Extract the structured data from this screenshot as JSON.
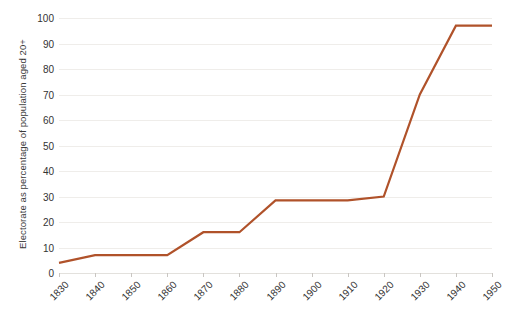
{
  "chart_data": {
    "type": "line",
    "title": "",
    "xlabel": "",
    "ylabel": "Electorate as percentage of population aged 20+",
    "x": [
      1830,
      1840,
      1850,
      1860,
      1870,
      1880,
      1890,
      1900,
      1910,
      1920,
      1930,
      1940,
      1950
    ],
    "categories": [
      "1830",
      "1840",
      "1850",
      "1860",
      "1870",
      "1880",
      "1890",
      "1900",
      "1910",
      "1920",
      "1930",
      "1940",
      "1950"
    ],
    "values": [
      4,
      7,
      7,
      7,
      16,
      16,
      28.5,
      28.5,
      28.5,
      30,
      70,
      97,
      97
    ],
    "series": [
      {
        "name": "Electorate",
        "values": [
          4,
          7,
          7,
          7,
          16,
          16,
          28.5,
          28.5,
          28.5,
          30,
          70,
          97,
          97
        ]
      }
    ],
    "ylim": [
      0,
      100
    ],
    "ytick_values": [
      0,
      10,
      20,
      30,
      40,
      50,
      60,
      70,
      80,
      90,
      100
    ],
    "ytick_labels": [
      "0",
      "10",
      "20",
      "30",
      "40",
      "50",
      "60",
      "70",
      "80",
      "90",
      "100"
    ],
    "xlim": [
      1830,
      1950
    ],
    "grid": "horizontal",
    "legend": "none",
    "line_color": "#B0522A",
    "gridline_color": "#EFEDEA",
    "text_color": "#333333",
    "background_color": "#FFFFFF"
  }
}
